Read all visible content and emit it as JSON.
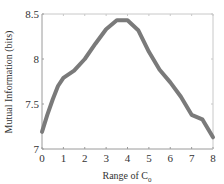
{
  "chart_data": {
    "type": "line",
    "title": "",
    "xlabel": "Range of C",
    "xlabel_subscript": "0",
    "ylabel": "Mutual Information (bits)",
    "xlim": [
      0,
      8
    ],
    "ylim": [
      7,
      8.5
    ],
    "grid": false,
    "legend": null,
    "x_ticks": [
      "0",
      "1",
      "2",
      "3",
      "4",
      "5",
      "6",
      "7",
      "8"
    ],
    "y_ticks": [
      "7",
      "7.5",
      "8",
      "8.5"
    ],
    "line_color": "#7a7a7a",
    "series": [
      {
        "name": "Mutual Information",
        "x": [
          0,
          0.25,
          0.5,
          0.75,
          1,
          1.5,
          2,
          2.5,
          3,
          3.5,
          4,
          4.5,
          5,
          5.5,
          6,
          6.5,
          7,
          7.5,
          8
        ],
        "y": [
          7.19,
          7.38,
          7.55,
          7.7,
          7.79,
          7.87,
          8.0,
          8.17,
          8.33,
          8.43,
          8.43,
          8.32,
          8.08,
          7.88,
          7.74,
          7.58,
          7.38,
          7.33,
          7.13
        ]
      }
    ]
  }
}
